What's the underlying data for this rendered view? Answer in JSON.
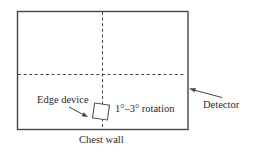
{
  "diagram": {
    "labels": {
      "edge_device": "Edge device",
      "rotation": "1°–3° rotation",
      "detector": "Detector",
      "chest_wall": "Chest wall"
    },
    "colors": {
      "line": "#454545",
      "text": "#2a2a2a",
      "background": "#ffffff"
    }
  }
}
